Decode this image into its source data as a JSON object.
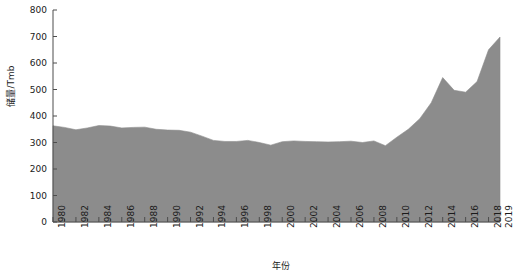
{
  "chart_data": {
    "type": "area",
    "title": "",
    "xlabel": "年份",
    "ylabel": "储量/Tmb",
    "xlim": [
      1980,
      2019
    ],
    "ylim": [
      0,
      800
    ],
    "yticks": [
      0,
      100,
      200,
      300,
      400,
      500,
      600,
      700,
      800
    ],
    "xticks": [
      1980,
      1982,
      1984,
      1986,
      1988,
      1990,
      1992,
      1994,
      1996,
      1998,
      2000,
      2002,
      2004,
      2006,
      2008,
      2010,
      2012,
      2014,
      2016,
      2018,
      2019
    ],
    "grid": false,
    "legend": null,
    "fill_color": "#8c8c8c",
    "axis_color": "#4d4d4d",
    "x": [
      1980,
      1981,
      1982,
      1983,
      1984,
      1985,
      1986,
      1987,
      1988,
      1989,
      1990,
      1991,
      1992,
      1993,
      1994,
      1995,
      1996,
      1997,
      1998,
      1999,
      2000,
      2001,
      2002,
      2003,
      2004,
      2005,
      2006,
      2007,
      2008,
      2009,
      2010,
      2011,
      2012,
      2013,
      2014,
      2015,
      2016,
      2017,
      2018,
      2019
    ],
    "values": [
      363,
      357,
      348,
      355,
      364,
      362,
      355,
      357,
      358,
      350,
      347,
      346,
      339,
      324,
      308,
      304,
      304,
      308,
      300,
      290,
      303,
      306,
      304,
      303,
      302,
      303,
      305,
      300,
      306,
      288,
      320,
      350,
      390,
      450,
      545,
      497,
      490,
      530,
      650,
      698
    ]
  },
  "axis": {
    "y_tick_labels": [
      "800",
      "700",
      "600",
      "500",
      "400",
      "300",
      "200",
      "100",
      "0"
    ],
    "x_tick_labels": [
      "1980",
      "1982",
      "1984",
      "1986",
      "1988",
      "1990",
      "1992",
      "1994",
      "1996",
      "1998",
      "2000",
      "2002",
      "2004",
      "2006",
      "2008",
      "2010",
      "2012",
      "2014",
      "2016",
      "2018",
      "2019"
    ]
  }
}
